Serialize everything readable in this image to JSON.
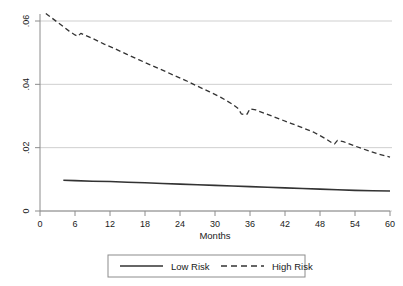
{
  "chart_data": {
    "type": "line",
    "title": "",
    "subtitle": "",
    "xlabel": "Months",
    "ylabel": "",
    "xlim": [
      0,
      60
    ],
    "ylim": [
      0,
      0.065
    ],
    "xticks": [
      0,
      6,
      12,
      18,
      24,
      30,
      36,
      42,
      48,
      54,
      60
    ],
    "xticklabels": [
      "0",
      "6",
      "12",
      "18",
      "24",
      "30",
      "36",
      "42",
      "48",
      "54",
      "60"
    ],
    "yticks": [
      0,
      0.02,
      0.04,
      0.06
    ],
    "yticklabels": [
      "0",
      ".02",
      ".04",
      ".06"
    ],
    "grid": "horizontal",
    "legend_position": "below-center",
    "series": [
      {
        "name": "Low Risk",
        "style": "solid",
        "color": "#333333",
        "x": [
          4,
          6,
          9,
          12,
          15,
          18,
          21,
          24,
          27,
          30,
          33,
          36,
          39,
          42,
          45,
          48,
          51,
          54,
          57,
          60
        ],
        "values": [
          0.0097,
          0.0096,
          0.0094,
          0.0093,
          0.0091,
          0.0089,
          0.0087,
          0.0085,
          0.0083,
          0.0081,
          0.0079,
          0.0077,
          0.0075,
          0.0073,
          0.0071,
          0.0069,
          0.0067,
          0.0065,
          0.0064,
          0.0063
        ]
      },
      {
        "name": "High Risk",
        "style": "dashed",
        "color": "#333333",
        "x": [
          1,
          3,
          5,
          6,
          6.5,
          7,
          9,
          11,
          13,
          15,
          17,
          19,
          21,
          23,
          25,
          27,
          29,
          31,
          33,
          34,
          34.5,
          35,
          35.5,
          36,
          37,
          39,
          41,
          43,
          45,
          47,
          49,
          50,
          50.5,
          51,
          52,
          54,
          56,
          58,
          60
        ],
        "values": [
          0.0624,
          0.0596,
          0.0568,
          0.0556,
          0.0552,
          0.0561,
          0.0545,
          0.0527,
          0.0511,
          0.0494,
          0.0477,
          0.0461,
          0.0445,
          0.0428,
          0.0412,
          0.0394,
          0.0377,
          0.0359,
          0.0337,
          0.0323,
          0.0307,
          0.0304,
          0.0306,
          0.0323,
          0.0319,
          0.0305,
          0.0291,
          0.0277,
          0.0263,
          0.0248,
          0.0228,
          0.0216,
          0.0212,
          0.0223,
          0.0219,
          0.0205,
          0.0192,
          0.018,
          0.017
        ]
      }
    ]
  },
  "legend": {
    "items": [
      {
        "label": "Low Risk",
        "style": "solid"
      },
      {
        "label": "High Risk",
        "style": "dashed"
      }
    ]
  },
  "axes": {
    "x_title": "Months"
  },
  "colors": {
    "line": "#333333",
    "axis": "#8c8c8c",
    "grid": "#cfcfcf",
    "legend_border": "#8c8c8c",
    "background": "#ffffff"
  }
}
